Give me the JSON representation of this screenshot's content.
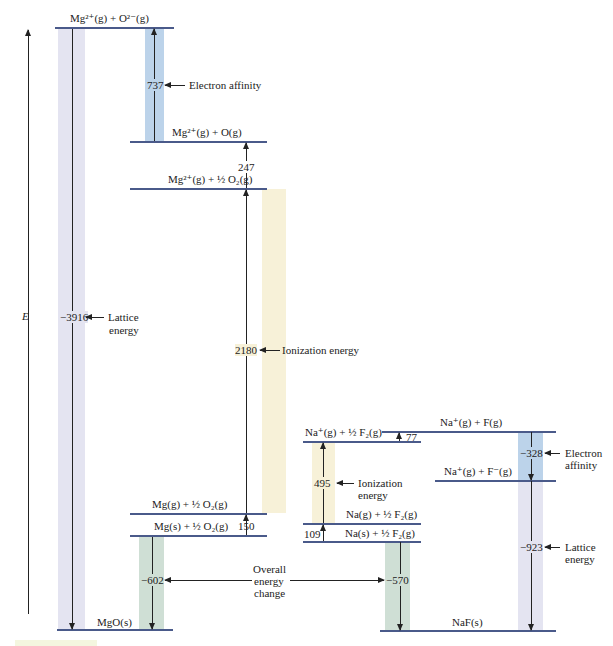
{
  "axis": {
    "label": "E"
  },
  "mgo": {
    "levels": {
      "top": "Mg²⁺(g) + O²⁻(g)",
      "mg2_o": "Mg²⁺(g) + O(g)",
      "mg2_o2": "Mg²⁺(g) + ½ O₂(g)",
      "mg_g": "Mg(g) + ½ O₂(g)",
      "mg_s": "Mg(s) + ½ O₂(g)",
      "mgo_s": "MgO(s)"
    },
    "values": {
      "lattice": "−3916",
      "electron_affinity": "737",
      "o2_dissociation": "247",
      "ionization": "2180",
      "sublimation": "150",
      "overall": "−602"
    },
    "notes": {
      "electron_affinity": "Electron affinity",
      "lattice_1": "Lattice",
      "lattice_2": "energy",
      "ionization": "Ionization energy"
    }
  },
  "naf": {
    "levels": {
      "na_plus_f": "Na⁺(g) + F(g)",
      "na_plus_f2": "Na⁺(g) + ½ F₂(g)",
      "na_plus_fminus": "Na⁺(g) + F⁻(g)",
      "na_g": "Na(g) + ½ F₂(g)",
      "na_s": "Na(s) + ½ F₂(g)",
      "naf_s": "NaF(s)"
    },
    "values": {
      "f2_dissociation": "77",
      "ionization": "495",
      "sublimation": "109",
      "electron_affinity": "−328",
      "lattice": "−923",
      "overall": "−570"
    },
    "notes": {
      "ionization_1": "Ionization",
      "ionization_2": "energy",
      "electron_affinity_1": "Electron",
      "electron_affinity_2": "affinity",
      "lattice_1": "Lattice",
      "lattice_2": "energy"
    }
  },
  "shared": {
    "overall_1": "Overall",
    "overall_2": "energy",
    "overall_3": "change"
  },
  "colors": {
    "lattice": "#e4e4f1",
    "electron_affinity": "#bcd3ea",
    "ionization": "#f7f1d8",
    "overall": "#cfdfd5",
    "level_line": "#4a5a8a"
  }
}
